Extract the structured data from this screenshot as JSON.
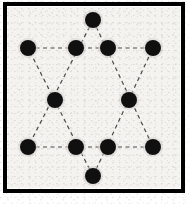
{
  "figure": {
    "canvas": {
      "width": 189,
      "height": 204
    }
  },
  "colors": {
    "dot_fill": "#101010",
    "line": "#4a4a4a",
    "frame": "#000000",
    "paper": "#f4f3f0",
    "page": "#ffffff",
    "halo": "#d8d6d2"
  },
  "frame": {
    "name": "outer-border",
    "x": 5,
    "y": 4,
    "width": 178,
    "height": 187,
    "stroke_width": 4
  },
  "paper": {
    "x": 8,
    "y": 7,
    "width": 172,
    "height": 181
  },
  "geometry": {
    "dot_radius": 8,
    "line_dash": "4 3.5",
    "line_width": 1.2
  },
  "chart_data": {
    "type": "scatter",
    "xlabel": "",
    "ylabel": "",
    "xlim": [
      0,
      189
    ],
    "ylim": [
      0,
      204
    ],
    "grid": false,
    "legend": "none",
    "point_count": 12,
    "points": [
      {
        "id": "p1",
        "label": "top-apex",
        "x": 93,
        "y": 20,
        "role": "star-point"
      },
      {
        "id": "p2",
        "label": "upper-left-outer",
        "x": 28,
        "y": 48,
        "role": "star-point"
      },
      {
        "id": "p3",
        "label": "upper-left-inner",
        "x": 76,
        "y": 48,
        "role": "intersection"
      },
      {
        "id": "p4",
        "label": "upper-right-inner",
        "x": 108,
        "y": 48,
        "role": "intersection"
      },
      {
        "id": "p5",
        "label": "upper-right-outer",
        "x": 153,
        "y": 48,
        "role": "star-point"
      },
      {
        "id": "p6",
        "label": "mid-left",
        "x": 55,
        "y": 100,
        "role": "intersection"
      },
      {
        "id": "p7",
        "label": "mid-right",
        "x": 129,
        "y": 100,
        "role": "intersection"
      },
      {
        "id": "p8",
        "label": "lower-left-outer",
        "x": 28,
        "y": 147,
        "role": "star-point"
      },
      {
        "id": "p9",
        "label": "lower-left-inner",
        "x": 76,
        "y": 147,
        "role": "intersection"
      },
      {
        "id": "p10",
        "label": "lower-right-inner",
        "x": 108,
        "y": 147,
        "role": "intersection"
      },
      {
        "id": "p11",
        "label": "lower-right-outer",
        "x": 153,
        "y": 147,
        "role": "star-point"
      },
      {
        "id": "p12",
        "label": "bottom-apex",
        "x": 93,
        "y": 176,
        "role": "star-point"
      }
    ],
    "triangles": [
      {
        "id": "t-up",
        "label": "upward-triangle",
        "vertices": [
          "p1",
          "p8",
          "p11"
        ]
      },
      {
        "id": "t-down",
        "label": "downward-triangle",
        "vertices": [
          "p12",
          "p2",
          "p5"
        ]
      }
    ],
    "edges": [
      {
        "from": "p1",
        "to": "p8",
        "style": "dashed"
      },
      {
        "from": "p1",
        "to": "p11",
        "style": "dashed"
      },
      {
        "from": "p8",
        "to": "p11",
        "style": "dashed"
      },
      {
        "from": "p12",
        "to": "p2",
        "style": "dashed"
      },
      {
        "from": "p12",
        "to": "p5",
        "style": "dashed"
      },
      {
        "from": "p2",
        "to": "p5",
        "style": "dashed"
      }
    ]
  }
}
